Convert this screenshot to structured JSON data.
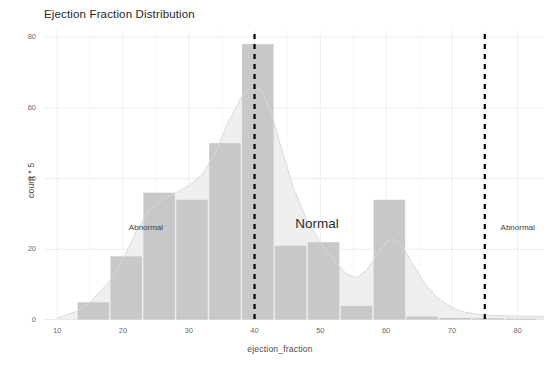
{
  "chart_data": {
    "type": "bar",
    "title": "Ejection Fraction Distribution",
    "xlabel": "ejection_fraction",
    "ylabel": "count * 5",
    "xlim": [
      8,
      84
    ],
    "ylim": [
      0,
      82
    ],
    "xticks": [
      10,
      20,
      30,
      40,
      50,
      60,
      70,
      80
    ],
    "yticks": [
      0,
      20,
      40,
      60,
      80
    ],
    "grid": true,
    "legend": "none",
    "bar_color": "#c6c8ca",
    "density_fill": "#efefef",
    "density_line": "#d8d8d8",
    "vline_color": "#000000",
    "grid_color": "#ebebeb",
    "bin_width": 5,
    "bins": [
      {
        "x0": 13,
        "x1": 18,
        "value": 5
      },
      {
        "x0": 18,
        "x1": 23,
        "value": 18
      },
      {
        "x0": 23,
        "x1": 28,
        "value": 36
      },
      {
        "x0": 28,
        "x1": 33,
        "value": 34
      },
      {
        "x0": 33,
        "x1": 38,
        "value": 50
      },
      {
        "x0": 38,
        "x1": 43,
        "value": 78
      },
      {
        "x0": 43,
        "x1": 48,
        "value": 21
      },
      {
        "x0": 48,
        "x1": 53,
        "value": 22
      },
      {
        "x0": 53,
        "x1": 58,
        "value": 4
      },
      {
        "x0": 58,
        "x1": 63,
        "value": 34
      },
      {
        "x0": 63,
        "x1": 68,
        "value": 1
      },
      {
        "x0": 68,
        "x1": 73,
        "value": 0.6
      },
      {
        "x0": 73,
        "x1": 78,
        "value": 0.5
      },
      {
        "x0": 78,
        "x1": 83,
        "value": 0.4
      }
    ],
    "density_curve": [
      {
        "x": 10,
        "y": 0.5
      },
      {
        "x": 13,
        "y": 2.5
      },
      {
        "x": 15,
        "y": 5
      },
      {
        "x": 18,
        "y": 11
      },
      {
        "x": 20,
        "y": 17
      },
      {
        "x": 22,
        "y": 25
      },
      {
        "x": 24,
        "y": 31
      },
      {
        "x": 26,
        "y": 34
      },
      {
        "x": 28,
        "y": 36
      },
      {
        "x": 30,
        "y": 38
      },
      {
        "x": 32,
        "y": 41
      },
      {
        "x": 34,
        "y": 47
      },
      {
        "x": 36,
        "y": 56
      },
      {
        "x": 38,
        "y": 63
      },
      {
        "x": 39.5,
        "y": 66
      },
      {
        "x": 41,
        "y": 65
      },
      {
        "x": 42.5,
        "y": 59
      },
      {
        "x": 44,
        "y": 49
      },
      {
        "x": 46,
        "y": 37
      },
      {
        "x": 48,
        "y": 28
      },
      {
        "x": 50,
        "y": 22
      },
      {
        "x": 52,
        "y": 17
      },
      {
        "x": 54,
        "y": 13
      },
      {
        "x": 55.5,
        "y": 12
      },
      {
        "x": 57,
        "y": 14
      },
      {
        "x": 58.5,
        "y": 18
      },
      {
        "x": 60,
        "y": 22
      },
      {
        "x": 61,
        "y": 23
      },
      {
        "x": 62.5,
        "y": 21
      },
      {
        "x": 64,
        "y": 16
      },
      {
        "x": 66,
        "y": 10
      },
      {
        "x": 68,
        "y": 6
      },
      {
        "x": 70,
        "y": 3.5
      },
      {
        "x": 72,
        "y": 2.2
      },
      {
        "x": 74,
        "y": 1.6
      },
      {
        "x": 76,
        "y": 1.3
      },
      {
        "x": 78,
        "y": 1.2
      },
      {
        "x": 80,
        "y": 1.1
      },
      {
        "x": 82,
        "y": 1.0
      },
      {
        "x": 84,
        "y": 1.0
      }
    ],
    "vlines": [
      {
        "x": 40
      },
      {
        "x": 75
      }
    ],
    "annotations": [
      {
        "text": "Abnormal",
        "x": 23.5,
        "y": 25.5,
        "size": "small"
      },
      {
        "text": "Normal",
        "x": 49.5,
        "y": 27.5,
        "size": "large"
      },
      {
        "text": "Abnormal",
        "x": 80,
        "y": 25.5,
        "size": "small"
      }
    ]
  }
}
